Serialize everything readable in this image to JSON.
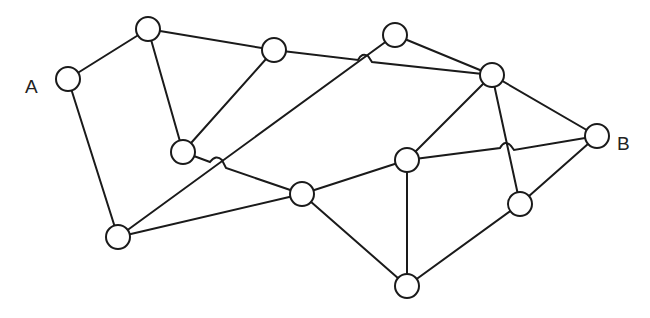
{
  "diagram": {
    "type": "network-graph",
    "labels": {
      "start": "A",
      "end": "B"
    },
    "colors": {
      "stroke": "#1a1a1a",
      "node_fill": "#ffffff",
      "background": "#ffffff"
    },
    "nodes": [
      {
        "id": "A",
        "x": 68,
        "y": 79,
        "label": "A"
      },
      {
        "id": "n1",
        "x": 148,
        "y": 29
      },
      {
        "id": "n2",
        "x": 274,
        "y": 50
      },
      {
        "id": "n3",
        "x": 395,
        "y": 35
      },
      {
        "id": "n4",
        "x": 492,
        "y": 75
      },
      {
        "id": "n5",
        "x": 183,
        "y": 152
      },
      {
        "id": "n6",
        "x": 118,
        "y": 237
      },
      {
        "id": "n7",
        "x": 302,
        "y": 194
      },
      {
        "id": "n8",
        "x": 407,
        "y": 160
      },
      {
        "id": "B",
        "x": 597,
        "y": 136,
        "label": "B"
      },
      {
        "id": "n10",
        "x": 520,
        "y": 204
      },
      {
        "id": "n11",
        "x": 407,
        "y": 286
      }
    ],
    "edges": [
      [
        "A",
        "n1"
      ],
      [
        "A",
        "n6"
      ],
      [
        "n1",
        "n2"
      ],
      [
        "n1",
        "n5"
      ],
      [
        "n2",
        "n5"
      ],
      [
        "n2",
        "n4"
      ],
      [
        "n3",
        "n4"
      ],
      [
        "n3",
        "n6"
      ],
      [
        "n5",
        "n7"
      ],
      [
        "n6",
        "n7"
      ],
      [
        "n4",
        "n8"
      ],
      [
        "n4",
        "B"
      ],
      [
        "n4",
        "n10"
      ],
      [
        "n7",
        "n8"
      ],
      [
        "n7",
        "n11"
      ],
      [
        "n8",
        "n11"
      ],
      [
        "n8",
        "B"
      ],
      [
        "n10",
        "B"
      ],
      [
        "n10",
        "n11"
      ]
    ]
  }
}
